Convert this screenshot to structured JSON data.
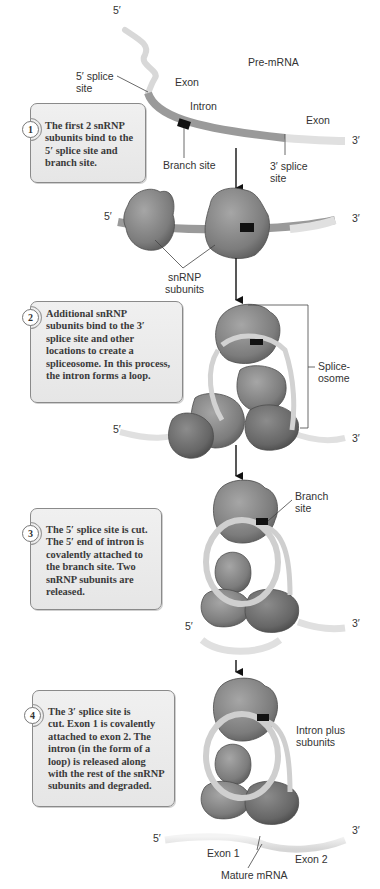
{
  "diagram": {
    "colors": {
      "exon": "#e4e4e4",
      "intron": "#9a9a9a",
      "snrnp": "#808080",
      "snrnp_dark": "#5e5e5e",
      "branch_site": "#111111",
      "step_box_fill": "#ebebeb",
      "step_box_border": "#8a8a8a",
      "arrow": "#111111"
    },
    "panel1": {
      "five_prime": "5′",
      "three_prime": "3′",
      "pre_mrna": "Pre-mRNA",
      "five_splice_site": "5′ splice\nsite",
      "exon_left": "Exon",
      "intron": "Intron",
      "exon_right": "Exon",
      "branch_site": "Branch site",
      "three_splice_site": "3′ splice\nsite"
    },
    "panel1b": {
      "five_prime": "5′",
      "three_prime": "3′",
      "snrnp_subunits": "snRNP\nsubunits"
    },
    "panel2": {
      "five_prime": "5′",
      "three_prime": "3′",
      "spliceosome": "Splice-\nosome"
    },
    "panel3": {
      "five_prime": "5′",
      "three_prime": "3′",
      "branch_site": "Branch\nsite"
    },
    "panel4": {
      "five_prime": "5′",
      "three_prime": "3′",
      "intron_plus_subunits": "Intron plus\nsubunits",
      "exon1": "Exon 1",
      "exon2": "Exon 2",
      "mature_mrna": "Mature mRNA"
    },
    "steps": [
      {
        "number": "1",
        "text": "The first 2 snRNP\nsubunits bind to the\n5′ splice site and\nbranch site."
      },
      {
        "number": "2",
        "text": "Additional snRNP\nsubunits bind to the 3′\nsplice site and other\nlocations to create a\nspliceosome. In this process,\nthe intron forms a loop."
      },
      {
        "number": "3",
        "text": "The 5′ splice site is cut.\nThe 5′ end of intron is\ncovalently attached to\nthe branch site. Two\nsnRNP subunits are\nreleased."
      },
      {
        "number": "4",
        "text": "The 3′ splice site is\ncut. Exon 1 is covalently\nattached to exon 2. The\nintron (in the form of a\nloop) is released along\nwith the rest of the snRNP\nsubunits and degraded."
      }
    ]
  }
}
